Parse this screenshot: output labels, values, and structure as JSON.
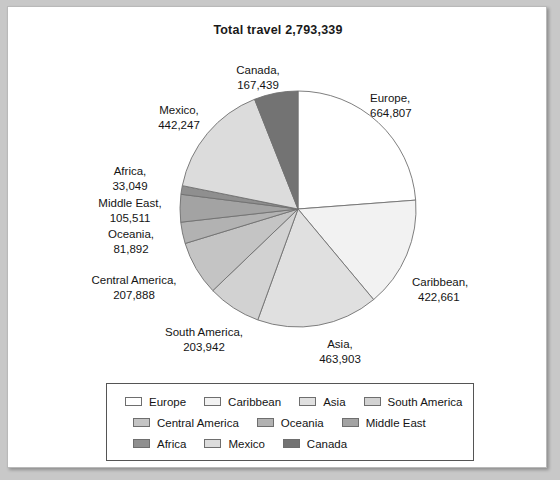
{
  "card": {
    "title": "Total travel 2,793,339"
  },
  "chart_data": {
    "type": "pie",
    "title": "Total travel 2,793,339",
    "total": 2793339,
    "total_formatted": "2,793,339",
    "start_angle_deg": 0,
    "direction": "clockwise",
    "legend_position": "bottom",
    "grid": false,
    "categories": [
      "Europe",
      "Caribbean",
      "Asia",
      "South America",
      "Central America",
      "Oceania",
      "Middle East",
      "Africa",
      "Mexico",
      "Canada"
    ],
    "values": [
      664807,
      422661,
      463903,
      203942,
      207888,
      81892,
      105511,
      33049,
      442247,
      167439
    ],
    "labels_formatted": [
      "664,807",
      "422,661",
      "463,903",
      "203,942",
      "207,888",
      "81,892",
      "105,511",
      "33,049",
      "442,247",
      "167,439"
    ],
    "colors": [
      "#ffffff",
      "#f2f2f2",
      "#e0e0e0",
      "#d2d2d2",
      "#c4c4c4",
      "#b2b2b2",
      "#a3a3a3",
      "#8f8f8f",
      "#dcdcdc",
      "#737373"
    ],
    "slices": [
      {
        "name": "Europe",
        "value": 664807,
        "value_formatted": "664,807",
        "color": "#ffffff"
      },
      {
        "name": "Caribbean",
        "value": 422661,
        "value_formatted": "422,661",
        "color": "#f2f2f2"
      },
      {
        "name": "Asia",
        "value": 463903,
        "value_formatted": "463,903",
        "color": "#e0e0e0"
      },
      {
        "name": "South America",
        "value": 203942,
        "value_formatted": "203,942",
        "color": "#d2d2d2"
      },
      {
        "name": "Central America",
        "value": 207888,
        "value_formatted": "207,888",
        "color": "#c4c4c4"
      },
      {
        "name": "Oceania",
        "value": 81892,
        "value_formatted": "81,892",
        "color": "#b2b2b2"
      },
      {
        "name": "Middle East",
        "value": 105511,
        "value_formatted": "105,511",
        "color": "#a3a3a3"
      },
      {
        "name": "Africa",
        "value": 33049,
        "value_formatted": "33,049",
        "color": "#8f8f8f"
      },
      {
        "name": "Mexico",
        "value": 442247,
        "value_formatted": "442,247",
        "color": "#dcdcdc"
      },
      {
        "name": "Canada",
        "value": 167439,
        "value_formatted": "167,439",
        "color": "#737373"
      }
    ]
  },
  "pie_labels": {
    "canada": {
      "name": "Canada,",
      "value": "167,439"
    },
    "europe": {
      "name": "Europe,",
      "value": "664,807"
    },
    "caribbean": {
      "name": "Caribbean,",
      "value": "422,661"
    },
    "asia": {
      "name": "Asia,",
      "value": "463,903"
    },
    "south_america": {
      "name": "South America,",
      "value": "203,942"
    },
    "central_america": {
      "name": "Central America,",
      "value": "207,888"
    },
    "oceania": {
      "name": "Oceania,",
      "value": "81,892"
    },
    "middle_east": {
      "name": "Middle East,",
      "value": "105,511"
    },
    "africa": {
      "name": "Africa,",
      "value": "33,049"
    },
    "mexico": {
      "name": "Mexico,",
      "value": "442,247"
    }
  },
  "legend": {
    "rows": [
      [
        {
          "label": "Europe",
          "color": "#ffffff"
        },
        {
          "label": "Caribbean",
          "color": "#f2f2f2"
        },
        {
          "label": "Asia",
          "color": "#e0e0e0"
        },
        {
          "label": "South America",
          "color": "#d2d2d2"
        }
      ],
      [
        {
          "label": "Central America",
          "color": "#c4c4c4"
        },
        {
          "label": "Oceania",
          "color": "#b2b2b2"
        },
        {
          "label": "Middle East",
          "color": "#a3a3a3"
        }
      ],
      [
        {
          "label": "Africa",
          "color": "#8f8f8f"
        },
        {
          "label": "Mexico",
          "color": "#dcdcdc"
        },
        {
          "label": "Canada",
          "color": "#737373"
        }
      ]
    ]
  }
}
